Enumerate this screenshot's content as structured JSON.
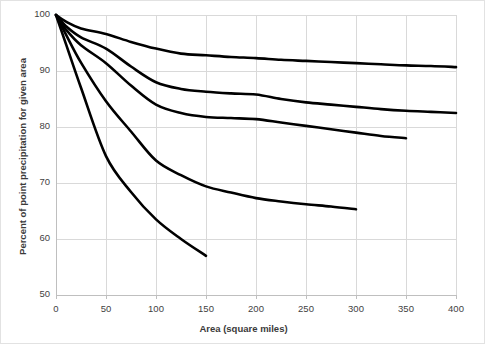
{
  "chart_data": {
    "type": "line",
    "title": "",
    "xlabel": "Area (square miles)",
    "ylabel": "Percent of point precipitation for given area",
    "xlim": [
      0,
      400
    ],
    "ylim": [
      50,
      100
    ],
    "xticks": [
      0,
      50,
      100,
      150,
      200,
      250,
      300,
      350,
      400
    ],
    "xticklabels": [
      "0",
      "50",
      "100",
      "150",
      "200",
      "250",
      "300",
      "350",
      "400"
    ],
    "yticks": [
      50,
      60,
      70,
      80,
      90,
      100
    ],
    "yticklabels": [
      "50",
      "60",
      "70",
      "80",
      "90",
      "100"
    ],
    "grid": "both",
    "legend": "none",
    "line_color": "#000000",
    "grid_color": "#d9d9d9",
    "axis_color": "#bfbfbf",
    "series": [
      {
        "name": "curve-1",
        "x": [
          0,
          10,
          25,
          50,
          75,
          100,
          125,
          150,
          175,
          200,
          225,
          250,
          275,
          300,
          325,
          350,
          375,
          400
        ],
        "values": [
          100,
          98.8,
          97.6,
          96.6,
          95.2,
          94.0,
          93.1,
          92.8,
          92.5,
          92.3,
          92.0,
          91.8,
          91.6,
          91.4,
          91.2,
          91.0,
          90.9,
          90.7
        ]
      },
      {
        "name": "curve-2",
        "x": [
          0,
          10,
          25,
          50,
          75,
          100,
          125,
          150,
          175,
          200,
          225,
          250,
          275,
          300,
          325,
          350,
          375,
          400
        ],
        "values": [
          100,
          98.0,
          96.0,
          94.0,
          90.8,
          88.0,
          86.8,
          86.3,
          86.0,
          85.8,
          85.0,
          84.4,
          84.0,
          83.6,
          83.2,
          82.9,
          82.7,
          82.5
        ]
      },
      {
        "name": "curve-3",
        "x": [
          0,
          10,
          25,
          50,
          75,
          100,
          125,
          150,
          175,
          200,
          225,
          250,
          275,
          300,
          325,
          350
        ],
        "values": [
          100,
          97.4,
          94.6,
          91.4,
          87.4,
          84.0,
          82.5,
          81.8,
          81.6,
          81.4,
          80.8,
          80.2,
          79.6,
          79.0,
          78.4,
          78.0
        ]
      },
      {
        "name": "curve-4",
        "x": [
          0,
          10,
          25,
          50,
          75,
          100,
          125,
          150,
          175,
          200,
          225,
          250,
          275,
          300
        ],
        "values": [
          100,
          96.5,
          91.5,
          84.6,
          79.2,
          74.0,
          71.4,
          69.4,
          68.3,
          67.3,
          66.7,
          66.2,
          65.8,
          65.3
        ]
      },
      {
        "name": "curve-5",
        "x": [
          0,
          10,
          25,
          50,
          75,
          100,
          125,
          150
        ],
        "values": [
          100,
          94.8,
          87.0,
          74.8,
          68.4,
          63.5,
          60.0,
          57.0
        ]
      }
    ]
  }
}
